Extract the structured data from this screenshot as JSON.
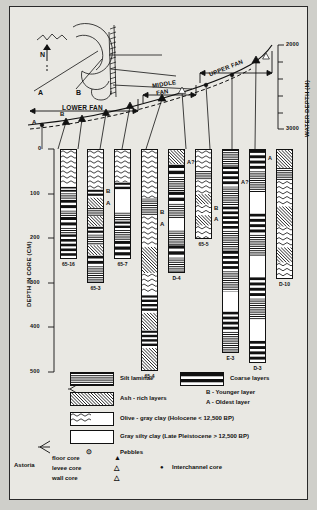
{
  "figure": {
    "type": "stratigraphic-correlation-diagram",
    "background": "#e9e8e3",
    "ink": "#111111"
  },
  "map_inset": {
    "north_label": "N",
    "point_a": "A",
    "point_b": "B"
  },
  "profile": {
    "zones": [
      {
        "label": "LOWER FAN"
      },
      {
        "label": "MIDDLE FAN",
        "line1": "MIDDLE",
        "line2": "FAN"
      },
      {
        "label": "UPPER FAN"
      }
    ],
    "marker_a": "A",
    "marker_b": "B",
    "right_axis": {
      "title": "WATER DEPTH (M)",
      "ticks": [
        "2000",
        "3000"
      ],
      "values": [
        2000,
        3000
      ]
    }
  },
  "left_axis": {
    "title": "DEPTH IN CORE (CM)",
    "ticks": [
      "0",
      "100",
      "200",
      "300",
      "400",
      "500"
    ],
    "values": [
      0,
      100,
      200,
      300,
      400,
      500
    ]
  },
  "chart_data": {
    "type": "table",
    "xlabel": "",
    "ylabel": "DEPTH IN CORE (CM)",
    "ylim": [
      0,
      500
    ],
    "grid": false,
    "legend_position": "bottom",
    "cores": [
      {
        "name": "65-16",
        "top_cm": 0,
        "bottom_cm": 245,
        "ash_labels": []
      },
      {
        "name": "65-3",
        "top_cm": 0,
        "bottom_cm": 300,
        "ash_labels": [
          "B",
          "A"
        ]
      },
      {
        "name": "65-7",
        "top_cm": 0,
        "bottom_cm": 245,
        "ash_labels": []
      },
      {
        "name": "65-4",
        "top_cm": 0,
        "bottom_cm": 495,
        "ash_labels": [
          "B",
          "A"
        ]
      },
      {
        "name": "D-4",
        "top_cm": 0,
        "bottom_cm": 275,
        "ash_labels": [
          "A?"
        ]
      },
      {
        "name": "65-5",
        "top_cm": 0,
        "bottom_cm": 200,
        "ash_labels": [
          "B",
          "A"
        ]
      },
      {
        "name": "E-3",
        "top_cm": 0,
        "bottom_cm": 455,
        "ash_labels": [
          "A?"
        ]
      },
      {
        "name": "D-3",
        "top_cm": 0,
        "bottom_cm": 475,
        "ash_labels": [
          "A"
        ]
      },
      {
        "name": "D-10",
        "top_cm": 0,
        "bottom_cm": 290,
        "ash_labels": [
          "B",
          "A"
        ]
      },
      {
        "name": "D-2",
        "top_cm": 0,
        "bottom_cm": 320,
        "ash_labels": []
      }
    ]
  },
  "legend": {
    "items": [
      {
        "id": "silt-laminae",
        "label": "Silt laminae",
        "pattern": "silt"
      },
      {
        "id": "coarse-layers",
        "label": "Coarse layers",
        "pattern": "coarse"
      },
      {
        "id": "ash-rich-layers",
        "label": "Ash - rich layers",
        "pattern": "ash"
      },
      {
        "id": "olive-gray-clay",
        "label": "Olive - gray clay (Holocene < 12,500 BP)",
        "pattern": "olive"
      },
      {
        "id": "gray-silty-clay",
        "label": "Gray silty clay (Late Pleistocene > 12,500 BP)",
        "pattern": "gray"
      }
    ],
    "ash_notes": {
      "b": "B - Younger layer",
      "a": "A - Oldest layer"
    },
    "pebbles": {
      "symbol": "⊙",
      "label": "Pebbles"
    },
    "astoria": {
      "group_label": "Astoria",
      "entries": [
        {
          "label": "floor core",
          "symbol": "▲"
        },
        {
          "label": "levee core",
          "symbol": "△"
        },
        {
          "label": "wall core",
          "symbol": "△"
        }
      ]
    },
    "interchannel": {
      "symbol": "●",
      "label": "Interchannel core"
    }
  }
}
